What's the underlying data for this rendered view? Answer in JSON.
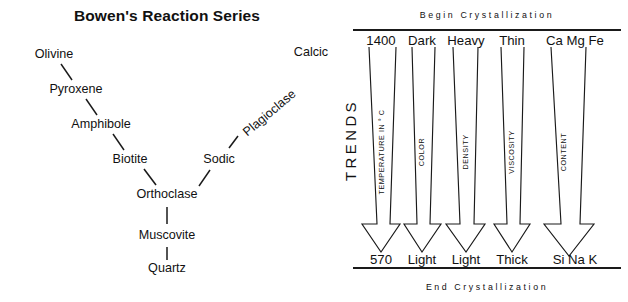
{
  "figure": {
    "width": 628,
    "height": 302,
    "background": "#ffffff",
    "ink_color": "#111111"
  },
  "left_panel": {
    "title": "Bowen's Reaction Series",
    "discontinuous_branch": {
      "name": "discontinuous series",
      "minerals": [
        "Olivine",
        "Pyroxene",
        "Amphibole",
        "Biotite"
      ]
    },
    "continuous_branch": {
      "name": "plagioclase feldspar series",
      "label": "Plagioclase",
      "end_members": [
        "Calcic",
        "Sodic"
      ]
    },
    "common_stem": [
      "Orthoclase",
      "Muscovite",
      "Quartz"
    ],
    "nodes": [
      {
        "label": "Olivine",
        "x": 54,
        "y": 58,
        "anchor": "middle",
        "rotate": 0
      },
      {
        "label": "Pyroxene",
        "x": 76,
        "y": 93,
        "anchor": "middle",
        "rotate": 0
      },
      {
        "label": "Amphibole",
        "x": 101,
        "y": 128,
        "anchor": "middle",
        "rotate": 0
      },
      {
        "label": "Biotite",
        "x": 130,
        "y": 163,
        "anchor": "middle",
        "rotate": 0
      },
      {
        "label": "Orthoclase",
        "x": 167,
        "y": 198,
        "anchor": "middle",
        "rotate": 0
      },
      {
        "label": "Muscovite",
        "x": 167,
        "y": 239,
        "anchor": "middle",
        "rotate": 0
      },
      {
        "label": "Quartz",
        "x": 167,
        "y": 272,
        "anchor": "middle",
        "rotate": 0
      },
      {
        "label": "Sodic",
        "x": 219,
        "y": 163,
        "anchor": "middle",
        "rotate": 0
      },
      {
        "label": "Plagioclase",
        "x": 272,
        "y": 116,
        "anchor": "middle",
        "rotate": -40
      },
      {
        "label": "Calcic",
        "x": 311,
        "y": 56,
        "anchor": "middle",
        "rotate": 0
      }
    ],
    "connectors": [
      {
        "from": "Olivine",
        "to": "Pyroxene",
        "x1": 61,
        "y1": 64,
        "x2": 72,
        "y2": 80
      },
      {
        "from": "Pyroxene",
        "to": "Amphibole",
        "x1": 86,
        "y1": 99,
        "x2": 97,
        "y2": 115
      },
      {
        "from": "Amphibole",
        "to": "Biotite",
        "x1": 113,
        "y1": 134,
        "x2": 124,
        "y2": 150
      },
      {
        "from": "Biotite",
        "to": "Orthoclase",
        "x1": 144,
        "y1": 169,
        "x2": 156,
        "y2": 185
      },
      {
        "from": "Orthoclase",
        "to": "Muscovite",
        "x1": 167,
        "y1": 207,
        "x2": 167,
        "y2": 224
      },
      {
        "from": "Muscovite",
        "to": "Quartz",
        "x1": 167,
        "y1": 247,
        "x2": 167,
        "y2": 260
      },
      {
        "from": "Orthoclase",
        "to": "Sodic",
        "x1": 199,
        "y1": 186,
        "x2": 210,
        "y2": 170
      },
      {
        "from": "Sodic",
        "to": "Plagioclase",
        "x1": 229,
        "y1": 148,
        "x2": 238,
        "y2": 136
      }
    ]
  },
  "right_panel": {
    "top_band_label": "Begin  Crystallization",
    "bottom_band_label": "End  Crystallization",
    "side_label": "TRENDS",
    "rules": {
      "top_y": 30,
      "bottom_y": 268,
      "x_start": 353,
      "x_end": 621
    },
    "columns": [
      {
        "id": "temperature",
        "head": "1400",
        "foot": "570",
        "caption": "TEMPERATURE IN ° C",
        "head_x": 381,
        "foot_x": 381,
        "arrow": {
          "top_left": 369,
          "top_right": 396,
          "neck_y": 224,
          "neck_left": 377,
          "neck_right": 390,
          "head_left": 362,
          "head_right": 400,
          "tip_x": 381,
          "tip_y": 252,
          "top_y": 47
        },
        "caption_x": 384,
        "caption_y": 152
      },
      {
        "id": "color",
        "head": "Dark",
        "foot": "Light",
        "caption": "COLOR",
        "head_x": 422,
        "foot_x": 422,
        "arrow": {
          "top_left": 412,
          "top_right": 435,
          "neck_y": 224,
          "neck_left": 417,
          "neck_right": 430,
          "head_left": 404,
          "head_right": 441,
          "tip_x": 422,
          "tip_y": 252,
          "top_y": 47
        },
        "caption_x": 424,
        "caption_y": 152
      },
      {
        "id": "density",
        "head": "Heavy",
        "foot": "Light",
        "caption": "DENSITY",
        "head_x": 466,
        "foot_x": 466,
        "arrow": {
          "top_left": 453,
          "top_right": 478,
          "neck_y": 224,
          "neck_left": 460,
          "neck_right": 474,
          "head_left": 446,
          "head_right": 485,
          "tip_x": 466,
          "tip_y": 252,
          "top_y": 47
        },
        "caption_x": 468,
        "caption_y": 152
      },
      {
        "id": "viscosity",
        "head": "Thin",
        "foot": "Thick",
        "caption": "VISCOSITY",
        "head_x": 512,
        "foot_x": 512,
        "arrow": {
          "top_left": 501,
          "top_right": 524,
          "neck_y": 224,
          "neck_left": 507,
          "neck_right": 520,
          "head_left": 494,
          "head_right": 530,
          "tip_x": 512,
          "tip_y": 252,
          "top_y": 47
        },
        "caption_x": 514,
        "caption_y": 152
      },
      {
        "id": "content",
        "head": "Ca Mg Fe",
        "foot": "Si Na K",
        "caption": "CONTENT",
        "head_x": 575,
        "foot_x": 575,
        "arrow": {
          "top_left": 551,
          "top_right": 586,
          "neck_y": 224,
          "neck_left": 561,
          "neck_right": 580,
          "head_left": 544,
          "head_right": 594,
          "tip_x": 569,
          "tip_y": 256,
          "top_y": 47
        },
        "caption_x": 566,
        "caption_y": 152
      }
    ]
  }
}
